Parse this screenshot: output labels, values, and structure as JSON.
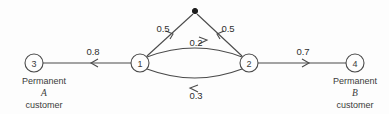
{
  "diagram": {
    "background_color": "#fdfdfd",
    "line_color": "#4a4a4a",
    "text_color": "#3b3b3b",
    "nodes": [
      {
        "id": "3",
        "label": "3",
        "cx": 34,
        "cy": 63,
        "r": 9
      },
      {
        "id": "1",
        "label": "1",
        "cx": 140,
        "cy": 63,
        "r": 9
      },
      {
        "id": "2",
        "label": "2",
        "cx": 249,
        "cy": 63,
        "r": 9
      },
      {
        "id": "4",
        "label": "4",
        "cx": 355,
        "cy": 63,
        "r": 9
      }
    ],
    "source": {
      "label": "source-dot",
      "cx": 195,
      "cy": 11,
      "r": 2.6
    },
    "edges": [
      {
        "id": "source-to-1",
        "weight": "0.5",
        "label_x": 163,
        "label_y": 32
      },
      {
        "id": "source-to-2",
        "weight": "0.5",
        "label_x": 228,
        "label_y": 32
      },
      {
        "id": "node1-to-node3",
        "weight": "0.8",
        "label_x": 93,
        "label_y": 55
      },
      {
        "id": "node1-to-node2",
        "weight": "0.2",
        "label_x": 196,
        "label_y": 47
      },
      {
        "id": "node2-to-node1",
        "weight": "0.3",
        "label_x": 196,
        "label_y": 96
      },
      {
        "id": "node2-to-node4",
        "weight": "0.7",
        "label_x": 303,
        "label_y": 55
      }
    ],
    "captions": [
      {
        "id": "caption-a",
        "anchor_x": 44,
        "line1": "Permanent",
        "line2": "A",
        "line3": "customer"
      },
      {
        "id": "caption-b",
        "anchor_x": 355,
        "line1": "Permanent",
        "line2": "B",
        "line3": "customer"
      }
    ]
  }
}
